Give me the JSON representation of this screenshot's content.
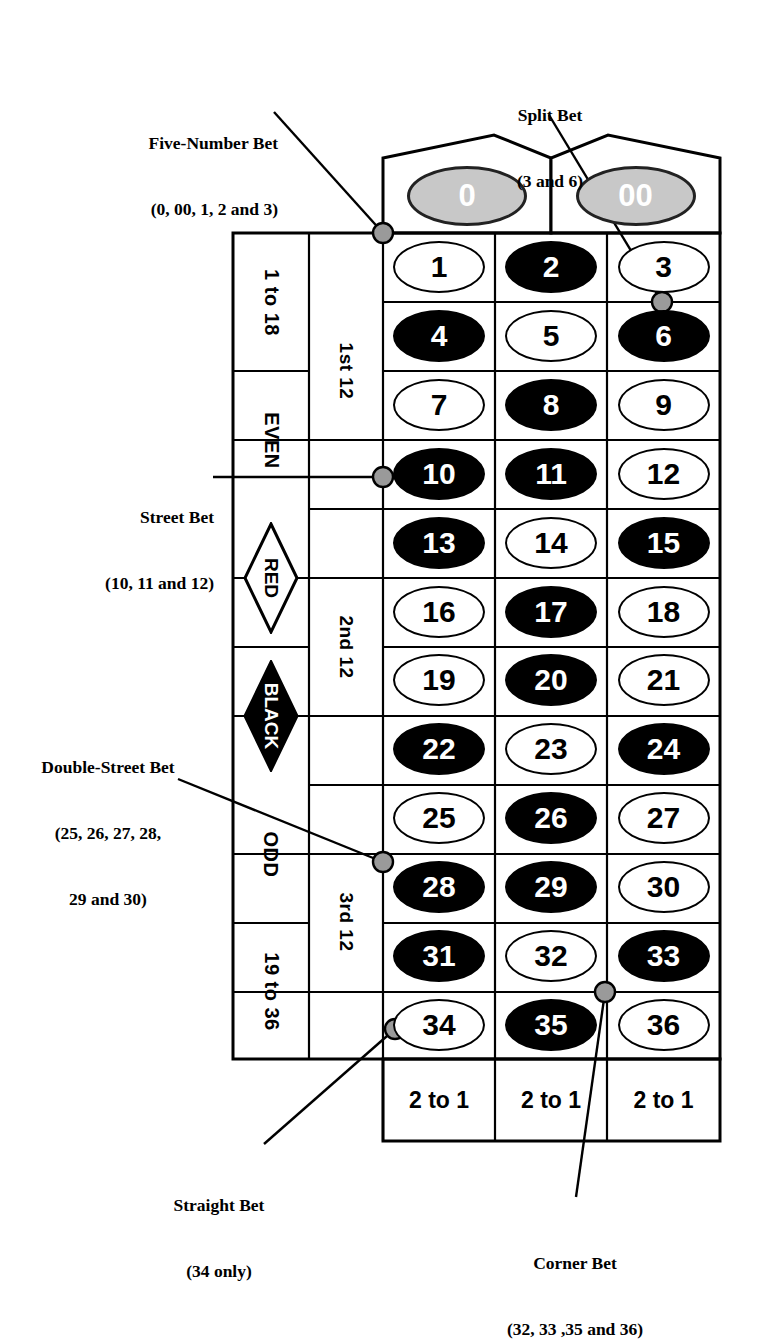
{
  "colors": {
    "black_pocket": "#000000",
    "red_pocket": "#ffffff",
    "zero_pocket": "#c8c8c8",
    "line": "#000000",
    "dot_fill": "#9a9a9a"
  },
  "zero_row": {
    "cells": [
      {
        "label": "0",
        "color": "green"
      },
      {
        "label": "00",
        "color": "green"
      }
    ]
  },
  "numbers": [
    {
      "label": "1",
      "color": "red"
    },
    {
      "label": "2",
      "color": "black"
    },
    {
      "label": "3",
      "color": "red"
    },
    {
      "label": "4",
      "color": "black"
    },
    {
      "label": "5",
      "color": "red"
    },
    {
      "label": "6",
      "color": "black"
    },
    {
      "label": "7",
      "color": "red"
    },
    {
      "label": "8",
      "color": "black"
    },
    {
      "label": "9",
      "color": "red"
    },
    {
      "label": "10",
      "color": "black"
    },
    {
      "label": "11",
      "color": "black"
    },
    {
      "label": "12",
      "color": "red"
    },
    {
      "label": "13",
      "color": "black"
    },
    {
      "label": "14",
      "color": "red"
    },
    {
      "label": "15",
      "color": "black"
    },
    {
      "label": "16",
      "color": "red"
    },
    {
      "label": "17",
      "color": "black"
    },
    {
      "label": "18",
      "color": "red"
    },
    {
      "label": "19",
      "color": "red"
    },
    {
      "label": "20",
      "color": "black"
    },
    {
      "label": "21",
      "color": "red"
    },
    {
      "label": "22",
      "color": "black"
    },
    {
      "label": "23",
      "color": "red"
    },
    {
      "label": "24",
      "color": "black"
    },
    {
      "label": "25",
      "color": "red"
    },
    {
      "label": "26",
      "color": "black"
    },
    {
      "label": "27",
      "color": "red"
    },
    {
      "label": "28",
      "color": "black"
    },
    {
      "label": "29",
      "color": "black"
    },
    {
      "label": "30",
      "color": "red"
    },
    {
      "label": "31",
      "color": "black"
    },
    {
      "label": "32",
      "color": "red"
    },
    {
      "label": "33",
      "color": "black"
    },
    {
      "label": "34",
      "color": "red"
    },
    {
      "label": "35",
      "color": "black"
    },
    {
      "label": "36",
      "color": "red"
    }
  ],
  "outside_column": [
    {
      "label": "1 to 18",
      "style": "plain"
    },
    {
      "label": "EVEN",
      "style": "plain"
    },
    {
      "label": "RED",
      "style": "diamond-outline"
    },
    {
      "label": "BLACK",
      "style": "diamond-filled"
    },
    {
      "label": "ODD",
      "style": "plain"
    },
    {
      "label": "19 to 36",
      "style": "plain"
    }
  ],
  "dozens": [
    {
      "label": "1st 12"
    },
    {
      "label": "2nd 12"
    },
    {
      "label": "3rd 12"
    }
  ],
  "column_bets": [
    {
      "label": "2 to 1"
    },
    {
      "label": "2 to 1"
    },
    {
      "label": "2 to 1"
    }
  ],
  "annotations": [
    {
      "name": "five-number-bet",
      "line1": "Five-Number Bet",
      "line2": "(0, 00, 1, 2 and 3)",
      "line3": ""
    },
    {
      "name": "split-bet",
      "line1": "Split Bet",
      "line2": "(3 and 6)",
      "line3": ""
    },
    {
      "name": "street-bet",
      "line1": "Street Bet",
      "line2": "(10, 11 and 12)",
      "line3": ""
    },
    {
      "name": "double-street-bet",
      "line1": "Double-Street Bet",
      "line2": "(25, 26, 27, 28,",
      "line3": "29 and 30)"
    },
    {
      "name": "straight-bet",
      "line1": "Straight Bet",
      "line2": "(34 only)",
      "line3": ""
    },
    {
      "name": "corner-bet",
      "line1": "Corner Bet",
      "line2": "(32, 33 ,35 and 36)",
      "line3": ""
    }
  ]
}
